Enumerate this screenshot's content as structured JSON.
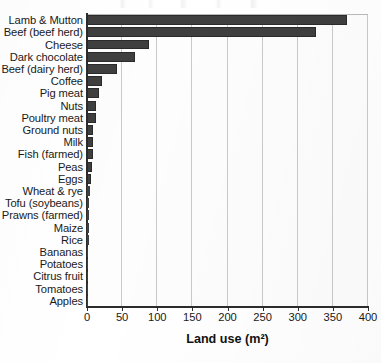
{
  "chart_data": {
    "type": "bar",
    "orientation": "horizontal",
    "title": "",
    "xlabel": "Land use (m²)",
    "ylabel": "",
    "xlim": [
      0,
      400
    ],
    "xticks": [
      0,
      50,
      100,
      150,
      200,
      250,
      300,
      350,
      400
    ],
    "xtick_labels": [
      "0",
      "50",
      "100",
      "150",
      "200",
      "250",
      "300",
      "350",
      "400"
    ],
    "grid": true,
    "grid_axis": "x",
    "legend": "none",
    "bar_color": "#3f3f3f",
    "categories": [
      "Lamb & Mutton",
      "Beef (beef herd)",
      "Cheese",
      "Dark chocolate",
      "Beef (dairy herd)",
      "Coffee",
      "Pig meat",
      "Nuts",
      "Poultry meat",
      "Ground nuts",
      "Milk",
      "Fish (farmed)",
      "Peas",
      "Eggs",
      "Wheat & rye",
      "Tofu (soybeans)",
      "Prawns (farmed)",
      "Maize",
      "Rice",
      "Bananas",
      "Potatoes",
      "Citrus fruit",
      "Tomatoes",
      "Apples"
    ],
    "values": [
      369.8,
      326.2,
      87.8,
      68.6,
      43.2,
      21.6,
      17.4,
      13.0,
      12.2,
      9.1,
      8.9,
      8.4,
      7.5,
      6.3,
      4.6,
      3.5,
      2.9,
      2.9,
      2.8,
      1.9,
      0.9,
      0.9,
      0.8,
      0.6
    ],
    "units": "m²"
  }
}
